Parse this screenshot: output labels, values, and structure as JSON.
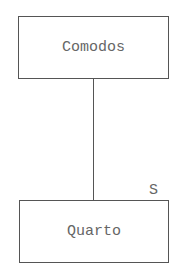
{
  "diagram": {
    "entities": [
      {
        "name": "Comodos"
      },
      {
        "name": "Quarto"
      }
    ],
    "relationship": {
      "from": "Comodos",
      "to": "Quarto",
      "multiplicity_label": "S"
    },
    "colors": {
      "border": "#555555",
      "text": "#666666",
      "background": "#ffffff"
    }
  }
}
